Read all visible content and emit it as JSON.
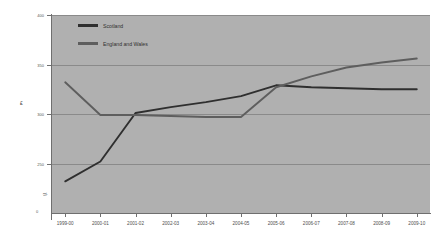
{
  "chart_data": {
    "type": "line",
    "title": "",
    "xlabel": "",
    "ylabel": "£",
    "ylim": [
      200,
      400
    ],
    "yticks": [
      250,
      300,
      350,
      400
    ],
    "ytick_labels": [
      "250",
      "300",
      "350",
      "400"
    ],
    "axis_break": true,
    "zero_label": "0",
    "grid": true,
    "legend_position": "top-left",
    "categories": [
      "1999-00",
      "2000-01",
      "2001-02",
      "2002-03",
      "2003-04",
      "2004-05",
      "2005-06",
      "2006-07",
      "2007-08",
      "2008-09",
      "2009-10"
    ],
    "series": [
      {
        "name": "Scotland",
        "color": "#2f2f2f",
        "values": [
          232,
          252,
          301,
          307,
          312,
          318,
          329,
          327,
          326,
          325,
          325
        ]
      },
      {
        "name": "England and Wales",
        "color": "#5e5e5e",
        "values": [
          332,
          299,
          299,
          298,
          297,
          297,
          327,
          338,
          347,
          352,
          356
        ]
      }
    ]
  },
  "legend": {
    "items": [
      {
        "label": "Scotland",
        "color": "#2f2f2f"
      },
      {
        "label": "England and Wales",
        "color": "#5e5e5e"
      }
    ]
  },
  "axis": {
    "unit_symbol": "£",
    "break_symbol": "≈",
    "zero": "0"
  },
  "colors": {
    "plot_background": "#b0b0b0",
    "page_background": "#ffffff",
    "gridline": "#8a8a8a",
    "axis": "#6f6f6f",
    "scotland": "#2f2f2f",
    "england_wales": "#5e5e5e"
  }
}
